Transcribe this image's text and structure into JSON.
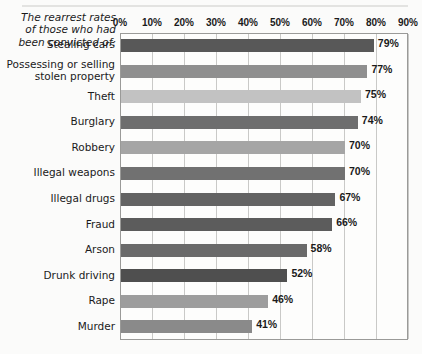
{
  "caption": {
    "lines": [
      "The rearrest rates",
      "of those who had",
      "been convicted of:"
    ]
  },
  "chart_data": {
    "type": "bar",
    "orientation": "horizontal",
    "xlabel": "",
    "ylabel": "",
    "xlim": [
      0,
      90
    ],
    "xticks": [
      0,
      10,
      20,
      30,
      40,
      50,
      60,
      70,
      80,
      90
    ],
    "xticklabels": [
      "0%",
      "10%",
      "20%",
      "30%",
      "40%",
      "50%",
      "60%",
      "70%",
      "80%",
      "90%"
    ],
    "grid": "vertical",
    "legend": "none",
    "value_suffix": "%",
    "categories": [
      "Stealing cars",
      "Possessing or selling stolen property",
      "Theft",
      "Burglary",
      "Robbery",
      "Illegal weapons",
      "Illegal drugs",
      "Fraud",
      "Arson",
      "Drunk driving",
      "Rape",
      "Murder"
    ],
    "values": [
      79,
      77,
      75,
      74,
      70,
      70,
      67,
      66,
      58,
      52,
      46,
      41
    ],
    "value_labels": [
      "79%",
      "77%",
      "75%",
      "74%",
      "70%",
      "70%",
      "67%",
      "66%",
      "58%",
      "52%",
      "46%",
      "41%"
    ],
    "bar_colors": [
      "#585858",
      "#8f8f8f",
      "#c2c2c2",
      "#6e6e6e",
      "#a5a5a5",
      "#717171",
      "#636363",
      "#5c5c5c",
      "#6a6a6a",
      "#4f4f4f",
      "#9d9d9d",
      "#8a8a8a"
    ],
    "category_label_lines": [
      [
        "Stealing cars"
      ],
      [
        "Possessing or selling",
        "stolen property"
      ],
      [
        "Theft"
      ],
      [
        "Burglary"
      ],
      [
        "Robbery"
      ],
      [
        "Illegal weapons"
      ],
      [
        "Illegal drugs"
      ],
      [
        "Fraud"
      ],
      [
        "Arson"
      ],
      [
        "Drunk driving"
      ],
      [
        "Rape"
      ],
      [
        "Murder"
      ]
    ]
  },
  "style": {
    "frame_color": "#9a9a98",
    "grid_color": "#c9c9c7",
    "background": "#fbfbfa"
  }
}
